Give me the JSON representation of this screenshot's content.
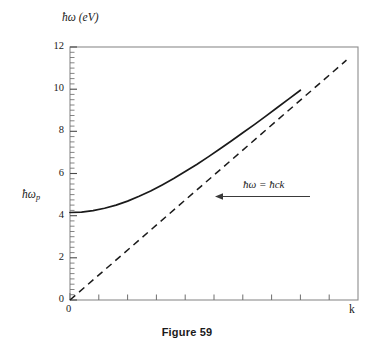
{
  "figure": {
    "caption": "Figure 59",
    "y_axis_label": "ħω (eV)",
    "x_axis_label": "k",
    "plasma_label": "ħω",
    "plasma_label_sub": "p",
    "annotation": "ħω = ħck",
    "frame_color": "#8c8c8c",
    "curve_color": "#1a1a1a",
    "text_color": "#1a1a1a",
    "background": "#ffffff"
  },
  "chart_data": {
    "type": "line",
    "title": "Figure 59",
    "xlabel": "k",
    "ylabel": "ħω (eV)",
    "xlim": [
      0,
      1
    ],
    "ylim": [
      0,
      12
    ],
    "grid": false,
    "legend_position": "none",
    "y_ticks": [
      0,
      2,
      4,
      6,
      8,
      10,
      12
    ],
    "y_tick_labels": [
      "0",
      "2",
      "4",
      "6",
      "8",
      "10",
      "12"
    ],
    "y_minor_tick_step": 0.25,
    "x_ticks": [
      0,
      0.1,
      0.2,
      0.3,
      0.4,
      0.5,
      0.6,
      0.7,
      0.8,
      0.9,
      1.0
    ],
    "x_tick_labels": [
      "0",
      "",
      "",
      "",
      "",
      "",
      "",
      "",
      "",
      "",
      ""
    ],
    "x_axis_end_label": "k",
    "plasma_frequency_eV": 4.15,
    "annotations": [
      {
        "text": "ħω = ħck",
        "x": 0.62,
        "y": 5.35,
        "arrow_to_x": 0.505,
        "arrow_to_y": 4.92,
        "style": "left-arrow"
      }
    ],
    "series": [
      {
        "name": "plasmon dispersion",
        "style": "solid",
        "color": "#1a1a1a",
        "x": [
          0.0,
          0.04,
          0.08,
          0.12,
          0.16,
          0.2,
          0.24,
          0.28,
          0.32,
          0.36,
          0.4,
          0.44,
          0.48,
          0.52,
          0.56,
          0.6,
          0.64,
          0.68,
          0.72,
          0.76,
          0.8,
          0.84,
          0.88,
          0.92,
          0.96
        ],
        "y": [
          4.15,
          4.17,
          4.24,
          4.35,
          4.5,
          4.69,
          4.92,
          5.17,
          5.46,
          5.76,
          6.09,
          6.43,
          6.79,
          7.16,
          7.54,
          7.93,
          8.32,
          8.72,
          9.13,
          9.54,
          9.95,
          10.37,
          10.79,
          11.21,
          11.63
        ]
      },
      {
        "name": "light line",
        "style": "dashed",
        "color": "#1a1a1a",
        "x": [
          0.0,
          1.0
        ],
        "y": [
          0.0,
          11.85
        ]
      }
    ]
  }
}
